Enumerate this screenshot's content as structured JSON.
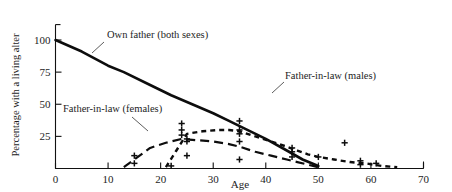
{
  "chart_data": {
    "type": "line",
    "title": "",
    "xlabel": "Age",
    "ylabel": "Percentage with a living alter",
    "xlim": [
      0,
      70
    ],
    "ylim": [
      0,
      112
    ],
    "grid": false,
    "legend_position": "inline-annotations",
    "xticks": [
      0,
      10,
      20,
      30,
      40,
      50,
      60,
      70
    ],
    "xtick_labels": [
      "0",
      "10",
      "20",
      "30",
      "40",
      "50",
      "60",
      "70"
    ],
    "yticks": [
      25,
      50,
      75,
      100
    ],
    "ytick_labels": [
      "25",
      "50",
      "75",
      "100"
    ],
    "series": [
      {
        "name": "Own father (both sexes)",
        "style": "solid",
        "x": [
          0,
          5,
          10,
          13,
          18,
          22,
          26,
          30,
          33,
          36,
          40,
          44,
          47,
          50
        ],
        "values": [
          100,
          91,
          80,
          75,
          65,
          57,
          50,
          43,
          37,
          31,
          23,
          14,
          7,
          2
        ]
      },
      {
        "name": "Father-in-law (females)",
        "style": "long-dash",
        "x": [
          13,
          15,
          18,
          21,
          24,
          27,
          30,
          33,
          35,
          38,
          41,
          44,
          46,
          48,
          50
        ],
        "values": [
          1,
          7,
          16,
          20,
          23,
          22,
          21,
          19,
          17,
          13,
          10,
          7,
          5,
          3,
          1
        ]
      },
      {
        "name": "Father-in-law (males)",
        "style": "short-dash",
        "x": [
          21,
          23,
          25,
          28,
          31,
          33,
          35,
          38,
          41,
          44,
          46,
          48,
          50,
          53,
          56,
          59,
          62,
          65
        ],
        "values": [
          1,
          14,
          27,
          29,
          30,
          30,
          29,
          25,
          21,
          17,
          14,
          11,
          9,
          7,
          5,
          4,
          2,
          1
        ]
      }
    ],
    "markers": [
      {
        "x": 15,
        "y": 10,
        "symbol": "+"
      },
      {
        "x": 15,
        "y": 4,
        "symbol": "+"
      },
      {
        "x": 22,
        "y": 2,
        "symbol": "+"
      },
      {
        "x": 24,
        "y": 35,
        "symbol": "+"
      },
      {
        "x": 24,
        "y": 30,
        "symbol": "+"
      },
      {
        "x": 24,
        "y": 26,
        "symbol": "+"
      },
      {
        "x": 25,
        "y": 23,
        "symbol": "+"
      },
      {
        "x": 25,
        "y": 21,
        "symbol": "+"
      },
      {
        "x": 25,
        "y": 10,
        "symbol": "+"
      },
      {
        "x": 35,
        "y": 37,
        "symbol": "+"
      },
      {
        "x": 35,
        "y": 30,
        "symbol": "+"
      },
      {
        "x": 35,
        "y": 27,
        "symbol": "+"
      },
      {
        "x": 35,
        "y": 21,
        "symbol": "+"
      },
      {
        "x": 35,
        "y": 7,
        "symbol": "+"
      },
      {
        "x": 45,
        "y": 16,
        "symbol": "+"
      },
      {
        "x": 45,
        "y": 13,
        "symbol": "+"
      },
      {
        "x": 45,
        "y": 9,
        "symbol": "+"
      },
      {
        "x": 50,
        "y": 9,
        "symbol": "+"
      },
      {
        "x": 55,
        "y": 20,
        "symbol": "+"
      },
      {
        "x": 58,
        "y": 6,
        "symbol": "+"
      },
      {
        "x": 58,
        "y": 3,
        "symbol": "+"
      },
      {
        "x": 61,
        "y": 4,
        "symbol": "+"
      }
    ],
    "annotations": [
      {
        "text": "Own father (both sexes)",
        "label_x_px": 107,
        "label_y_px": 38
      },
      {
        "text": "Father-in-law (females)",
        "label_x_px": 63,
        "label_y_px": 112
      },
      {
        "text": "Father-in-law (males)",
        "label_x_px": 285,
        "label_y_px": 79
      }
    ]
  },
  "colors": {
    "ink": "#0d0d0d",
    "axis": "#111111",
    "background": "#ffffff"
  }
}
